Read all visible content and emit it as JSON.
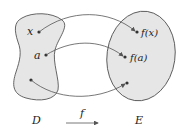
{
  "diagram": {
    "domain_set": {
      "label": "D",
      "points": [
        "x",
        "a",
        ""
      ]
    },
    "codomain_set": {
      "label": "E",
      "points": [
        "f(x)",
        "f(a)",
        ""
      ]
    },
    "map": {
      "label": "f"
    },
    "colors": {
      "fill": "#e6e6e6",
      "stroke": "#555555",
      "arrow": "#555555",
      "text": "#222222"
    }
  }
}
